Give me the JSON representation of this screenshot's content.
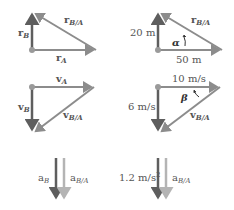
{
  "colors": {
    "dark_arrow": "#5e5e5e",
    "mid_arrow": "#8c8c8c",
    "light_arrow": "#b4b4b4",
    "origin_dot": "#9a9a9a",
    "text": "#555555"
  },
  "position_symbolic": {
    "r_B": {
      "base": "r",
      "sub": "B"
    },
    "r_A": {
      "base": "r",
      "sub": "A"
    },
    "r_BA": {
      "base": "r",
      "sub": "B/A"
    }
  },
  "position_numeric": {
    "vertical": "20 m",
    "horizontal": "50 m",
    "r_BA": {
      "base": "r",
      "sub": "B/A"
    },
    "angle": "α"
  },
  "velocity_symbolic": {
    "v_A": {
      "base": "v",
      "sub": "A"
    },
    "v_B": {
      "base": "v",
      "sub": "B"
    },
    "v_BA": {
      "base": "v",
      "sub": "B/A"
    }
  },
  "velocity_numeric": {
    "horizontal": "10 m/s",
    "vertical": "6 m/s",
    "v_BA": {
      "base": "v",
      "sub": "B/A"
    },
    "angle": "β"
  },
  "acceleration_symbolic": {
    "a_B": {
      "base": "a",
      "sub": "B"
    },
    "a_BA": {
      "base": "a",
      "sub": "B/A"
    }
  },
  "acceleration_numeric": {
    "value": "1.2 m/s",
    "value_sup": "2",
    "a_BA": {
      "base": "a",
      "sub": "B/A"
    }
  }
}
